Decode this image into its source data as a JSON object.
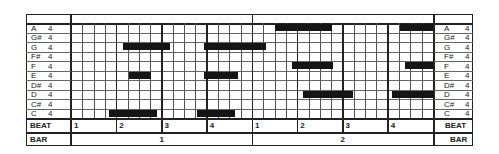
{
  "grid": {
    "pitches": [
      {
        "name": "A",
        "octave": "4"
      },
      {
        "name": "G#",
        "octave": "4"
      },
      {
        "name": "G",
        "octave": "4"
      },
      {
        "name": "F#",
        "octave": "4"
      },
      {
        "name": "F",
        "octave": "4"
      },
      {
        "name": "E",
        "octave": "4"
      },
      {
        "name": "D#",
        "octave": "4"
      },
      {
        "name": "D",
        "octave": "4"
      },
      {
        "name": "C#",
        "octave": "4"
      },
      {
        "name": "C",
        "octave": "4"
      }
    ],
    "columns_per_beat": 4,
    "beats_per_bar": 4,
    "bars": 2,
    "beat_label": "BEAT",
    "bar_label": "BAR",
    "beat_numbers": [
      "1",
      "2",
      "3",
      "4",
      "1",
      "2",
      "3",
      "4"
    ],
    "bar_numbers": [
      "1",
      "2"
    ],
    "notes": [
      {
        "pitch": "G4",
        "start": 4.6,
        "end": 8.75
      },
      {
        "pitch": "E4",
        "start": 5.1,
        "end": 7.1
      },
      {
        "pitch": "C4",
        "start": 3.4,
        "end": 7.6
      },
      {
        "pitch": "G4",
        "start": 11.8,
        "end": 17.2
      },
      {
        "pitch": "E4",
        "start": 11.8,
        "end": 14.8
      },
      {
        "pitch": "C4",
        "start": 11.1,
        "end": 14.5
      },
      {
        "pitch": "A4",
        "start": 18.0,
        "end": 23.1
      },
      {
        "pitch": "F4",
        "start": 19.5,
        "end": 23.2
      },
      {
        "pitch": "D4",
        "start": 20.5,
        "end": 24.9
      },
      {
        "pitch": "A4",
        "start": 29.1,
        "end": 32
      },
      {
        "pitch": "F4",
        "start": 29.5,
        "end": 32
      },
      {
        "pitch": "D4",
        "start": 28.4,
        "end": 32
      }
    ]
  },
  "colors": {
    "note": "#151515",
    "line": "#222222",
    "background": "#ffffff"
  }
}
